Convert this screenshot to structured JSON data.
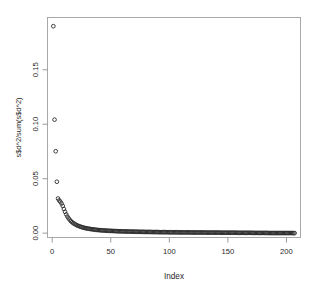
{
  "figure": {
    "kind": "scree-plot",
    "background_color": "#ffffff",
    "point_color": "#2b2b2b",
    "axis_color": "#9a9a9a",
    "box_color": "#a8a8a8",
    "marker_symbol": "open-circle"
  },
  "chart_data": {
    "type": "scatter",
    "title": "",
    "subtitle": "",
    "xlabel": "Index",
    "ylabel": "s$d^2/sum(s$d^2)",
    "xlim": [
      -4,
      212
    ],
    "ylim": [
      -0.004,
      0.198
    ],
    "xticks": [
      0,
      50,
      100,
      150,
      200
    ],
    "xtick_labels": [
      "0",
      "50",
      "100",
      "150",
      "200"
    ],
    "yticks": [
      0.0,
      0.05,
      0.1,
      0.15
    ],
    "ytick_labels": [
      "0.00",
      "0.05",
      "0.10",
      "0.15"
    ],
    "grid": false,
    "legend": null,
    "annotations": [],
    "marker": "open circle",
    "n_points": 207,
    "x": [
      1,
      2,
      3,
      4,
      5,
      6,
      7,
      8,
      9,
      10,
      11,
      12,
      13,
      14,
      15,
      16,
      17,
      18,
      19,
      20,
      21,
      22,
      23,
      24,
      25,
      26,
      27,
      28,
      29,
      30,
      31,
      32,
      33,
      34,
      35,
      36,
      37,
      38,
      39,
      40,
      41,
      42,
      43,
      44,
      45,
      46,
      47,
      48,
      49,
      50,
      51,
      52,
      53,
      54,
      55,
      56,
      57,
      58,
      59,
      60,
      61,
      62,
      63,
      64,
      65,
      66,
      67,
      68,
      69,
      70,
      71,
      72,
      73,
      74,
      75,
      76,
      77,
      78,
      79,
      80,
      81,
      82,
      83,
      84,
      85,
      86,
      87,
      88,
      89,
      90,
      91,
      92,
      93,
      94,
      95,
      96,
      97,
      98,
      99,
      100,
      101,
      102,
      103,
      104,
      105,
      106,
      107,
      108,
      109,
      110,
      111,
      112,
      113,
      114,
      115,
      116,
      117,
      118,
      119,
      120,
      121,
      122,
      123,
      124,
      125,
      126,
      127,
      128,
      129,
      130,
      131,
      132,
      133,
      134,
      135,
      136,
      137,
      138,
      139,
      140,
      141,
      142,
      143,
      144,
      145,
      146,
      147,
      148,
      149,
      150,
      151,
      152,
      153,
      154,
      155,
      156,
      157,
      158,
      159,
      160,
      161,
      162,
      163,
      164,
      165,
      166,
      167,
      168,
      169,
      170,
      171,
      172,
      173,
      174,
      175,
      176,
      177,
      178,
      179,
      180,
      181,
      182,
      183,
      184,
      185,
      186,
      187,
      188,
      189,
      190,
      191,
      192,
      193,
      194,
      195,
      196,
      197,
      198,
      199,
      200,
      201,
      202,
      203,
      204,
      205,
      206,
      207
    ],
    "y": [
      0.19,
      0.1042,
      0.0752,
      0.0472,
      0.0318,
      0.03,
      0.0288,
      0.0272,
      0.025,
      0.0222,
      0.0196,
      0.0172,
      0.0152,
      0.0136,
      0.0122,
      0.011,
      0.01,
      0.0092,
      0.0085,
      0.0079,
      0.0073,
      0.0068,
      0.0064,
      0.006,
      0.0056,
      0.0053,
      0.005,
      0.0047,
      0.0045,
      0.0043,
      0.0041,
      0.0039,
      0.0037,
      0.0036,
      0.0034,
      0.0033,
      0.0031,
      0.003,
      0.0029,
      0.0028,
      0.0027,
      0.0026,
      0.0025,
      0.0025,
      0.0024,
      0.0023,
      0.0022,
      0.0022,
      0.0021,
      0.0021,
      0.002,
      0.002,
      0.0019,
      0.0019,
      0.0018,
      0.0018,
      0.0017,
      0.0017,
      0.0017,
      0.0016,
      0.0016,
      0.0016,
      0.0015,
      0.0015,
      0.0015,
      0.0014,
      0.0014,
      0.0014,
      0.0014,
      0.0013,
      0.0013,
      0.0013,
      0.0013,
      0.0012,
      0.0012,
      0.0012,
      0.0012,
      0.0012,
      0.0011,
      0.0011,
      0.0011,
      0.0011,
      0.0011,
      0.0011,
      0.001,
      0.001,
      0.001,
      0.001,
      0.001,
      0.001,
      0.0009,
      0.0009,
      0.0009,
      0.0009,
      0.0009,
      0.0009,
      0.0009,
      0.0009,
      0.0008,
      0.0008,
      0.0008,
      0.0008,
      0.0008,
      0.0008,
      0.0008,
      0.0008,
      0.0008,
      0.0007,
      0.0007,
      0.0007,
      0.0007,
      0.0007,
      0.0007,
      0.0007,
      0.0007,
      0.0007,
      0.0007,
      0.0007,
      0.0006,
      0.0006,
      0.0006,
      0.0006,
      0.0006,
      0.0006,
      0.0006,
      0.0006,
      0.0006,
      0.0006,
      0.0006,
      0.0006,
      0.0005,
      0.0005,
      0.0005,
      0.0005,
      0.0005,
      0.0005,
      0.0005,
      0.0005,
      0.0005,
      0.0005,
      0.0005,
      0.0005,
      0.0005,
      0.0004,
      0.0004,
      0.0004,
      0.0004,
      0.0004,
      0.0004,
      0.0004,
      0.0004,
      0.0004,
      0.0004,
      0.0004,
      0.0004,
      0.0004,
      0.0004,
      0.0003,
      0.0003,
      0.0003,
      0.0003,
      0.0003,
      0.0003,
      0.0003,
      0.0003,
      0.0003,
      0.0003,
      0.0003,
      0.0003,
      0.0003,
      0.0003,
      0.0002,
      0.0002,
      0.0002,
      0.0002,
      0.0002,
      0.0002,
      0.0002,
      0.0002,
      0.0002,
      0.0002,
      0.0002,
      0.0002,
      0.0002,
      0.0001,
      0.0001,
      0.0001,
      0.0001,
      0.0001,
      0.0001,
      0.0001,
      0.0001,
      0.0001,
      0.0001,
      0.0001,
      0.0001,
      0.0001,
      0.0001,
      0.0001,
      0.0001,
      0.0001,
      0.0001,
      0.0001,
      0.0001,
      0.0001,
      0.0,
      0.0
    ]
  }
}
